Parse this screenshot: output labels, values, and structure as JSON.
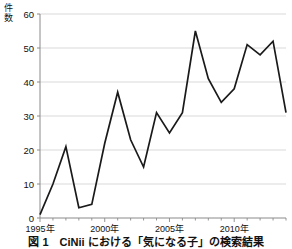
{
  "figure": {
    "caption": "図 1　CiNii における「気になる子」の検索結果",
    "axis_title_vertical": "件数"
  },
  "chart_data": {
    "type": "line",
    "title": "",
    "xlabel": "",
    "ylabel": "件数",
    "x": [
      1995,
      1996,
      1997,
      1998,
      1999,
      2000,
      2001,
      2002,
      2003,
      2004,
      2005,
      2006,
      2007,
      2008,
      2009,
      2010,
      2011,
      2012,
      2013,
      2014
    ],
    "values": [
      1,
      10,
      21,
      3,
      4,
      22,
      37,
      23,
      15,
      31,
      25,
      31,
      55,
      41,
      34,
      38,
      51,
      48,
      52,
      31
    ],
    "series": [
      {
        "name": "件数",
        "values": [
          1,
          10,
          21,
          3,
          4,
          22,
          37,
          23,
          15,
          31,
          25,
          31,
          55,
          41,
          34,
          38,
          51,
          48,
          52,
          31
        ]
      }
    ],
    "xlim": [
      1995,
      2014
    ],
    "ylim": [
      0,
      60
    ],
    "ytick_labels": [
      "0",
      "10",
      "20",
      "30",
      "40",
      "50",
      "60"
    ],
    "ytick_values": [
      0,
      10,
      20,
      30,
      40,
      50,
      60
    ],
    "xtick_labels": [
      "1995年",
      "2000年",
      "2005年",
      "2010年"
    ],
    "xtick_values": [
      1995,
      2000,
      2005,
      2010
    ],
    "grid": true,
    "grid_axis": "y",
    "legend": false,
    "line_color": "#1a1a1a",
    "grid_color": "#cfcfcf",
    "axis_color": "#8a8a8a",
    "background": "#ffffff"
  }
}
